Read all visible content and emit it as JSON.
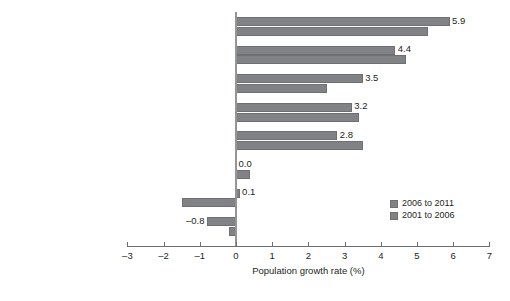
{
  "chart_data": {
    "type": "bar",
    "orientation": "horizontal",
    "title": "",
    "xlabel": "Population growth rate (%)",
    "ylabel": "",
    "xlim": [
      -3,
      7
    ],
    "xticks": [
      -3,
      -2,
      -1,
      0,
      1,
      2,
      3,
      4,
      5,
      6,
      7
    ],
    "xticklabels": [
      "–3",
      "–2",
      "–1",
      "0",
      "1",
      "2",
      "3",
      "4",
      "5",
      "6",
      "7"
    ],
    "grid": false,
    "legend_position": "bottom-right",
    "categories": [
      "Canada",
      "United States",
      "United Kingdom",
      "Italy",
      "France (metropolitaine)",
      "Japan",
      "Russia",
      "Germany"
    ],
    "series": [
      {
        "name": "2006 to 2011",
        "color": "#808285",
        "values": [
          5.9,
          4.4,
          3.5,
          3.2,
          2.8,
          0.0,
          0.1,
          -0.8
        ],
        "data_labels": [
          "5.9",
          "4.4",
          "3.5",
          "3.2",
          "2.8",
          "0.0",
          "0.1",
          "–0.8"
        ]
      },
      {
        "name": "2001 to 2006",
        "color": "#808285",
        "values": [
          5.3,
          4.7,
          2.5,
          3.4,
          3.5,
          0.4,
          -1.5,
          -0.2
        ],
        "data_labels": [
          "",
          "",
          "",
          "",
          "",
          "",
          "",
          ""
        ]
      }
    ]
  },
  "legend": {
    "items": [
      {
        "label": "2006 to 2011",
        "color": "#808285"
      },
      {
        "label": "2001 to 2006",
        "color": "#808285"
      }
    ]
  }
}
